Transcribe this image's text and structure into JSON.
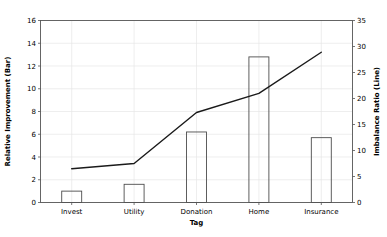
{
  "chart_data": {
    "type": "bar",
    "title": "",
    "subtitle": "",
    "xlabel": "Tag",
    "ylabel": "Relative Improvement (Bar)",
    "y2label": "Imbalance Ratio (Line)",
    "categories": [
      "Invest",
      "Utility",
      "Donation",
      "Home",
      "Insurance"
    ],
    "ylim": [
      0,
      16
    ],
    "y2lim": [
      0,
      35
    ],
    "yticks": [
      "0",
      "2",
      "4",
      "6",
      "8",
      "10",
      "12",
      "14",
      "16"
    ],
    "y2ticks": [
      "0",
      "5",
      "10",
      "15",
      "20",
      "25",
      "30",
      "35"
    ],
    "grid": true,
    "legend": "none",
    "series": [
      {
        "name": "Relative Improvement (Bar)",
        "type": "bar",
        "axis": "left",
        "values": [
          1.0,
          1.6,
          6.2,
          12.8,
          5.7
        ]
      },
      {
        "name": "Imbalance Ratio (Line)",
        "type": "line",
        "axis": "right",
        "values": [
          6.5,
          7.5,
          17.3,
          21.0,
          28.9
        ]
      }
    ]
  },
  "colors": {
    "background": "#ffffff",
    "grid": "#e6e6e6",
    "spine": "#555555",
    "bar_edge": "#4d4d4d",
    "line": "#1a1a1a",
    "text": "#000000"
  }
}
